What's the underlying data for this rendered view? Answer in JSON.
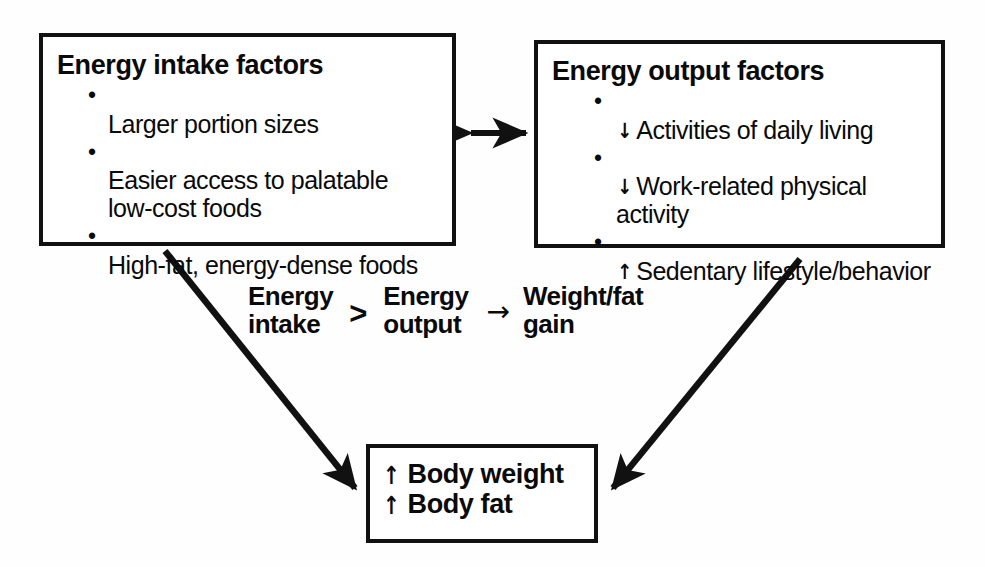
{
  "diagram": {
    "background_color": "#fefefe",
    "line_color": "#111111",
    "intake_box": {
      "title": "Energy intake factors",
      "items": [
        {
          "trend": "",
          "text": "Larger portion sizes"
        },
        {
          "trend": "",
          "text": "Easier access to palatable\nlow-cost foods"
        },
        {
          "trend": "",
          "text": "High-fat, energy-dense foods"
        }
      ]
    },
    "output_box": {
      "title": "Energy output factors",
      "items": [
        {
          "trend": "↓",
          "text": "Activities of daily living"
        },
        {
          "trend": "↓",
          "text": "Work-related physical\nactivity"
        },
        {
          "trend": "↑",
          "text": "Sedentary lifestyle/behavior"
        }
      ]
    },
    "equation": {
      "left_term": "Energy\nintake",
      "operator": ">",
      "right_term": "Energy\noutput",
      "arrow": "→",
      "outcome": "Weight/fat\ngain"
    },
    "result_box": {
      "lines": [
        {
          "trend": "↑",
          "text": "Body weight"
        },
        {
          "trend": "↑",
          "text": "Body fat"
        }
      ]
    },
    "connectors": {
      "bidirectional_label": "↔",
      "intake_to_result_label": "intake factors lead to body weight and fat gain",
      "output_to_result_label": "output factors lead to body weight and fat gain"
    }
  }
}
